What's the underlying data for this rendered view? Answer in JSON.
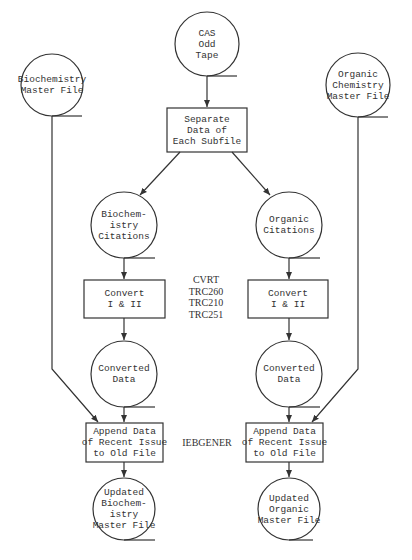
{
  "diagram": {
    "type": "flowchart",
    "nodes": {
      "cas_tape": {
        "shape": "circle",
        "lines": [
          "CAS",
          "Odd",
          "Tape"
        ]
      },
      "separate": {
        "shape": "box",
        "lines": [
          "Separate",
          "Data of",
          "Each Subfile"
        ]
      },
      "biochem_master": {
        "shape": "circle",
        "lines": [
          "Biochemistry",
          "Master File"
        ]
      },
      "organic_master": {
        "shape": "circle",
        "lines": [
          "Organic",
          "Chemistry",
          "Master File"
        ]
      },
      "biochem_citations": {
        "shape": "circle",
        "lines": [
          "Biochem-",
          "istry",
          "Citations"
        ]
      },
      "organic_citations": {
        "shape": "circle",
        "lines": [
          "Organic",
          "Citations"
        ]
      },
      "convert_left": {
        "shape": "box",
        "lines": [
          "Convert",
          "I & II"
        ]
      },
      "convert_right": {
        "shape": "box",
        "lines": [
          "Convert",
          "I & II"
        ]
      },
      "converted_left": {
        "shape": "circle",
        "lines": [
          "Converted",
          "Data"
        ]
      },
      "converted_right": {
        "shape": "circle",
        "lines": [
          "Converted",
          "Data"
        ]
      },
      "append_left": {
        "shape": "box",
        "lines": [
          "Append Data",
          "of Recent Issue",
          "to Old File"
        ]
      },
      "append_right": {
        "shape": "box",
        "lines": [
          "Append Data",
          "of Recent Issue",
          "to Old File"
        ]
      },
      "updated_biochem": {
        "shape": "circle",
        "lines": [
          "Updated",
          "Biochem-",
          "istry",
          "Master File"
        ]
      },
      "updated_organic": {
        "shape": "circle",
        "lines": [
          "Updated",
          "Organic",
          "Master File"
        ]
      }
    },
    "labels": {
      "convert_programs": [
        "CVRT",
        "TRC260",
        "TRC210",
        "TRC251"
      ],
      "append_program": [
        "IEBGENER"
      ]
    },
    "edges": [
      [
        "cas_tape",
        "separate"
      ],
      [
        "separate",
        "biochem_citations"
      ],
      [
        "separate",
        "organic_citations"
      ],
      [
        "biochem_citations",
        "convert_left"
      ],
      [
        "organic_citations",
        "convert_right"
      ],
      [
        "convert_left",
        "converted_left"
      ],
      [
        "convert_right",
        "converted_right"
      ],
      [
        "converted_left",
        "append_left"
      ],
      [
        "converted_right",
        "append_right"
      ],
      [
        "biochem_master",
        "append_left"
      ],
      [
        "organic_master",
        "append_right"
      ],
      [
        "append_left",
        "updated_biochem"
      ],
      [
        "append_right",
        "updated_organic"
      ]
    ],
    "colors": {
      "stroke": "#333333",
      "background": "#ffffff"
    }
  }
}
